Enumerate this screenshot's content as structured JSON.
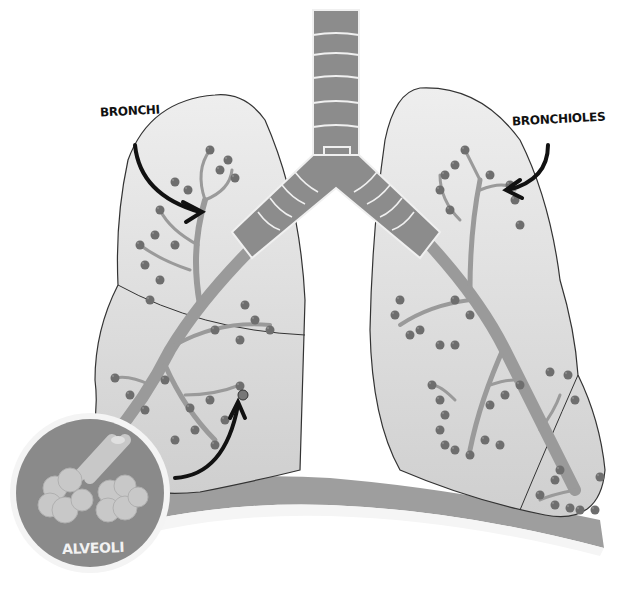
{
  "diagram": {
    "style": "grayscale illustration",
    "labels": {
      "bronchi": "BRONCHI",
      "bronchioles": "BRONCHIOLES",
      "alveoli": "ALVEOLI"
    },
    "parts": [
      "trachea",
      "bronchi",
      "bronchioles",
      "left-lung",
      "right-lung",
      "diaphragm",
      "alveoli-inset"
    ],
    "colors": {
      "lung_fill": "#d2d2d2",
      "airway": "#9a9a9a",
      "trachea": "#8c8c8c",
      "alveoli_cluster": "#6e6e6e",
      "inset_bg": "#8a8a8a",
      "inset_alveoli": "#c8c8c8",
      "diaphragm": "#9e9e9e",
      "outline": "#333333",
      "arrow": "#111111"
    }
  }
}
